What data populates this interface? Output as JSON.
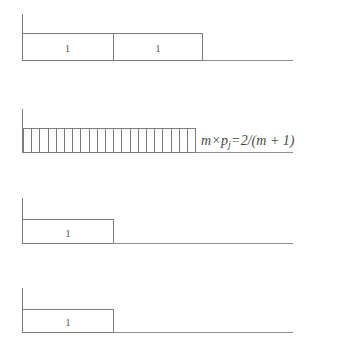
{
  "figure": {
    "background_color": "#ffffff",
    "line_color": "#7c7c7c",
    "text_color": "#5d5d5d"
  },
  "rows": [
    {
      "id": "row-1",
      "kind": "segmented-bar",
      "cells": [
        {
          "label": "1"
        },
        {
          "label": "1"
        }
      ],
      "total_units": 2
    },
    {
      "id": "row-2",
      "kind": "hatched-bar",
      "annotation": {
        "lhs_factor": "m",
        "operator": "×",
        "lhs_term": "p",
        "lhs_subscript": "j",
        "equals": "=",
        "rhs": "2/(m + 1)",
        "full_text": "m × pⱼ = 2/(m + 1)"
      },
      "stripe_count": 22
    },
    {
      "id": "row-3",
      "kind": "segmented-bar",
      "cells": [
        {
          "label": "1"
        }
      ],
      "total_units": 1
    },
    {
      "id": "row-4",
      "kind": "segmented-bar",
      "cells": [
        {
          "label": "1"
        }
      ],
      "total_units": 1
    }
  ]
}
